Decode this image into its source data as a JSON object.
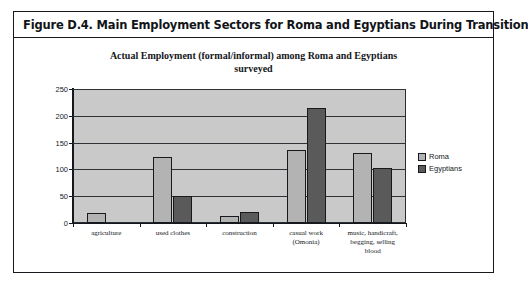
{
  "figure": {
    "caption": "Figure D.4.  Main Employment Sectors for Roma and Egyptians During Transition"
  },
  "chart_data": {
    "type": "bar",
    "title_line1": "Actual Employment (formal/informal) among Roma and Egyptians",
    "title_line2": "surveyed",
    "title": "Actual Employment (formal/informal) among Roma and Egyptians surveyed",
    "categories": [
      "agriculture",
      "used clothes",
      "construction",
      "casual work (Omonia)",
      "music, handicraft, begging, selling blood"
    ],
    "category_lines": [
      [
        "agriculture"
      ],
      [
        "used clothes"
      ],
      [
        "construction"
      ],
      [
        "casual work",
        "(Omonia)"
      ],
      [
        "music, handicraft,",
        "begging, selling",
        "blood"
      ]
    ],
    "series": [
      {
        "name": "Roma",
        "color": "#b3b3b3",
        "values": [
          18,
          123,
          13,
          136,
          130
        ]
      },
      {
        "name": "Egyptians",
        "color": "#5a5a5a",
        "values": [
          0,
          50,
          20,
          215,
          103
        ]
      }
    ],
    "ylim": [
      0,
      250
    ],
    "yticks": [
      0,
      50,
      100,
      150,
      200,
      250
    ],
    "ytick_labels": [
      "0",
      "50",
      "100",
      "150",
      "200",
      "250"
    ],
    "xlabel": "",
    "ylabel": "",
    "grid": true,
    "legend_position": "right",
    "plot_background": "#c9c9c9"
  }
}
